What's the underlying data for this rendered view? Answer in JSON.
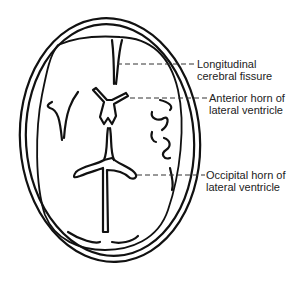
{
  "diagram": {
    "labels": [
      {
        "id": "longitudinal",
        "line1": "Longitudinal",
        "line2": "cerebral fissure"
      },
      {
        "id": "anterior",
        "line1": "Anterior horn of",
        "line2": "lateral ventricle"
      },
      {
        "id": "occipital",
        "line1": "Occipital horn of",
        "line2": "lateral ventricle"
      }
    ]
  }
}
